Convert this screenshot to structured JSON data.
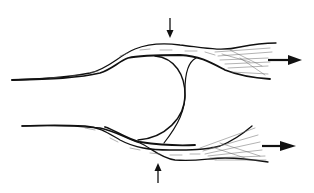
{
  "diagram": {
    "type": "line-illustration",
    "background": "#ffffff",
    "ink_color": "#111111",
    "hatch_color": "#555555",
    "elements": [
      {
        "name": "upper-band",
        "description": "tapered fibrous band, left tip to frayed right end"
      },
      {
        "name": "lower-band",
        "description": "tapered fibrous band, left tip to frayed right end"
      },
      {
        "name": "central-loop",
        "description": "curved membrane connecting the two bands"
      },
      {
        "name": "compression-arrow-top",
        "direction": "down"
      },
      {
        "name": "compression-arrow-bottom",
        "direction": "up"
      },
      {
        "name": "tension-arrow-upper",
        "direction": "right"
      },
      {
        "name": "tension-arrow-lower",
        "direction": "right"
      }
    ],
    "labels": []
  }
}
